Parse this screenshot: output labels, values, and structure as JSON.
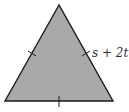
{
  "diagram": {
    "shape": "equilateral-triangle",
    "fill_color": "#a9a9a9",
    "stroke_color": "#1a1a1a",
    "side_label": "s + 2t",
    "tick_marks": 3
  }
}
